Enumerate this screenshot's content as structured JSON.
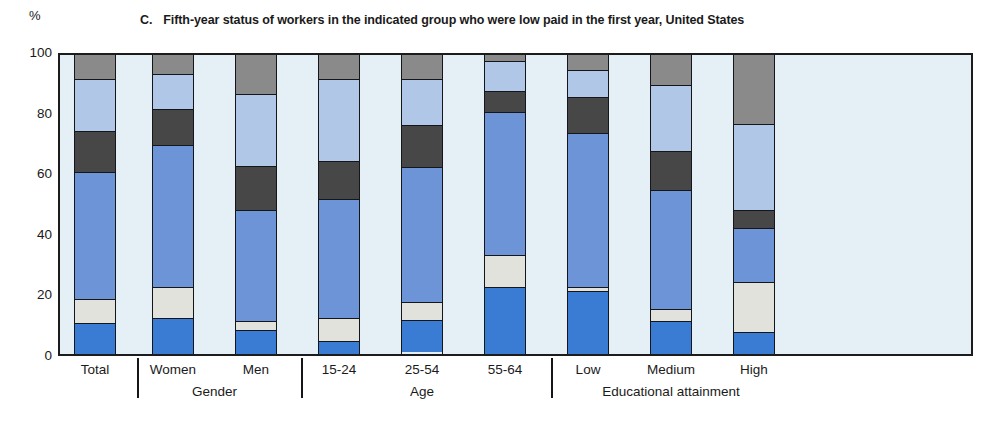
{
  "chart_data": {
    "type": "bar",
    "subtype": "stacked-column-100",
    "title_letter": "C.",
    "title_text": "Fifth-year status of workers in the indicated group who were low paid in the first year, United States",
    "xlabel": "",
    "ylabel": "%",
    "ylim": [
      0,
      100
    ],
    "yticks": [
      0,
      20,
      40,
      60,
      80,
      100
    ],
    "grid": false,
    "legend": "none",
    "categories": [
      "Total",
      "Women",
      "Men",
      "15-24",
      "25-54",
      "55-64",
      "Low",
      "Medium",
      "High"
    ],
    "groups": [
      {
        "label": "",
        "categories": [
          "Total"
        ]
      },
      {
        "label": "Gender",
        "categories": [
          "Women",
          "Men"
        ]
      },
      {
        "label": "Age",
        "categories": [
          "15-24",
          "25-54",
          "55-64"
        ]
      },
      {
        "label": "Educational attainment",
        "categories": [
          "Low",
          "Medium",
          "High"
        ]
      }
    ],
    "series": [
      {
        "name": "segment-1",
        "color": "#3a7cd3",
        "values": [
          10.5,
          12.0,
          8.0,
          4.5,
          11.0,
          22.5,
          21.0,
          11.0,
          7.5
        ]
      },
      {
        "name": "segment-2",
        "color": "#e2e2dd",
        "values": [
          8.0,
          10.5,
          3.0,
          7.5,
          6.0,
          10.5,
          1.5,
          4.0,
          16.5
        ]
      },
      {
        "name": "segment-3",
        "color": "#6d94d7",
        "values": [
          42.5,
          47.5,
          37.0,
          40.0,
          45.0,
          48.0,
          51.5,
          40.0,
          18.0
        ]
      },
      {
        "name": "segment-4",
        "color": "#474747",
        "values": [
          13.5,
          12.0,
          15.0,
          12.5,
          14.0,
          7.0,
          12.0,
          13.0,
          6.0
        ]
      },
      {
        "name": "segment-5",
        "color": "#b0c7e8",
        "values": [
          17.5,
          11.5,
          24.0,
          27.5,
          15.5,
          10.0,
          9.0,
          22.0,
          29.0
        ]
      },
      {
        "name": "segment-6",
        "color": "#8a8a8a",
        "values": [
          8.0,
          6.5,
          13.0,
          8.0,
          8.0,
          2.0,
          5.0,
          10.0,
          23.0
        ]
      }
    ],
    "colors": {
      "plot_background": "#e4eff6",
      "axis": "#15161a",
      "page_background": "#ffffff"
    }
  }
}
